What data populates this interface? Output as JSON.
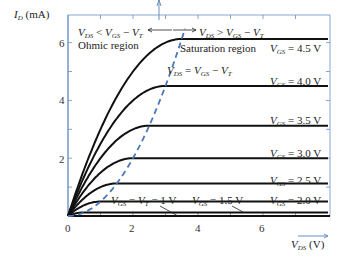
{
  "chart_data": {
    "type": "line",
    "title": "",
    "xlabel": "V_DS (V)",
    "ylabel": "I_D (mA)",
    "xlim": [
      0,
      8
    ],
    "ylim": [
      0,
      6.8
    ],
    "x_ticks": [
      "0",
      "2",
      "4",
      "6"
    ],
    "y_ticks": [
      "2",
      "4",
      "6"
    ],
    "grid": false,
    "k_mA_per_V2": 0.5,
    "V_T": 1.0,
    "series": [
      {
        "name": "V_GS = 4.5 V",
        "V_GS": 4.5,
        "saturation_current_mA": 6.125
      },
      {
        "name": "V_GS = 4.0 V",
        "V_GS": 4.0,
        "saturation_current_mA": 4.5
      },
      {
        "name": "V_GS = 3.5 V",
        "V_GS": 3.5,
        "saturation_current_mA": 3.125
      },
      {
        "name": "V_GS = 3.0 V",
        "V_GS": 3.0,
        "saturation_current_mA": 2.0
      },
      {
        "name": "V_GS = 2.5 V",
        "V_GS": 2.5,
        "saturation_current_mA": 1.125
      },
      {
        "name": "V_GS = 2.0 V",
        "V_GS": 2.0,
        "saturation_current_mA": 0.5
      },
      {
        "name": "V_GS = 1.5 V",
        "V_GS": 1.5,
        "saturation_current_mA": 0.125
      },
      {
        "name": "V_GS = V_T = 1 V",
        "V_GS": 1.0,
        "saturation_current_mA": 0.0
      }
    ],
    "boundary_curve": {
      "name": "V_DS = V_GS - V_T",
      "style": "dashed",
      "color": "#4a78b8"
    },
    "annotations": [
      {
        "text": "V_DS < V_GS - V_T",
        "region": "ohmic"
      },
      {
        "text": "Ohmic region"
      },
      {
        "text": "V_DS > V_GS - V_T",
        "region": "saturation"
      },
      {
        "text": "Saturation region"
      },
      {
        "text": "V_DS = V_GS - V_T"
      }
    ]
  },
  "labels": {
    "ylabel_main": "I",
    "ylabel_sub": "D",
    "ylabel_unit": " (mA)",
    "xlabel_main": "V",
    "xlabel_sub": "DS",
    "xlabel_unit": " (V)",
    "ohmic_cond": "V_DS < V_GS − V_T",
    "ohmic_region": "Ohmic region",
    "sat_cond": "V_DS > V_GS − V_T",
    "sat_region": "Saturation region",
    "boundary": "V_DS = V_GS − V_T",
    "vgs45": "= 4.5 V",
    "vgs40": "= 4.0 V",
    "vgs35": "= 3.5 V",
    "vgs30": "= 3.0 V",
    "vgs25": "= 2.5 V",
    "vgs20": "= 2.0 V",
    "vgs15": "= 1.5 V",
    "vgs10": "= V",
    "vgs10b": " = 1 V",
    "tick_x0": "0",
    "tick_x2": "2",
    "tick_x4": "4",
    "tick_x6": "6",
    "tick_y2": "2",
    "tick_y4": "4",
    "tick_y6": "6"
  },
  "colors": {
    "curve": "#111111",
    "axis": "#6a8fc0",
    "boundary": "#4a78b8",
    "text": "#222222"
  }
}
